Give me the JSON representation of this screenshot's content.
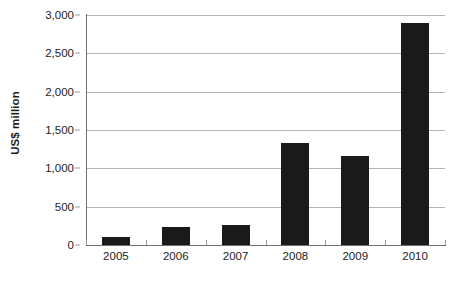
{
  "chart_data": {
    "type": "bar",
    "title": "",
    "subtitle": "",
    "xlabel": "",
    "ylabel": "US$ million",
    "categories": [
      "2005",
      "2006",
      "2007",
      "2008",
      "2009",
      "2010"
    ],
    "values": [
      100,
      230,
      260,
      1330,
      1160,
      2900
    ],
    "series": [
      {
        "name": "US$ million",
        "values": [
          100,
          230,
          260,
          1330,
          1160,
          2900
        ]
      }
    ],
    "ylim": [
      0,
      3000
    ],
    "xlim": [
      0,
      6
    ],
    "y_ticks": [
      0,
      500,
      1000,
      1500,
      2000,
      2500,
      3000
    ],
    "y_tick_labels": [
      "0",
      "500",
      "1,000",
      "1,500",
      "2,000",
      "2,500",
      "3,000"
    ],
    "x_tick_labels": [
      "2005",
      "2006",
      "2007",
      "2008",
      "2009",
      "2010"
    ],
    "grid": true,
    "grid_axis": "y",
    "legend": false,
    "legend_position": "none",
    "annotations": [],
    "colors": {
      "bar": "#1a1a1a",
      "gridline": "#b4b4b4",
      "axis": "#6f6f6f",
      "tick": "#9a9a9a",
      "text": "#1c1c1c",
      "background": "#ffffff"
    }
  }
}
